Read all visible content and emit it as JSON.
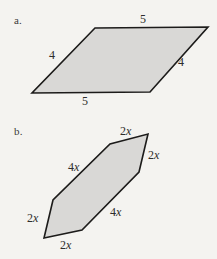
{
  "figure": {
    "background_color": "#f4f3f0",
    "shape_fill_color": "#d9d8d6",
    "shape_stroke_color": "#1c1b1a",
    "parts": [
      {
        "key": "a",
        "marker": "a.",
        "shape": "parallelogram",
        "points": "95,28 208,27 150,92 32,93",
        "labels": [
          {
            "key": "top",
            "text": "5"
          },
          {
            "key": "left",
            "text": "4"
          },
          {
            "key": "right",
            "text": "4"
          },
          {
            "key": "bottom",
            "text": "5"
          }
        ]
      },
      {
        "key": "b",
        "marker": "b.",
        "shape": "hexagon",
        "points": "148,134 139,172 82,230 44,238 53,200 110,144",
        "labels": [
          {
            "key": "top",
            "text": "2x"
          },
          {
            "key": "upper-right",
            "text": "2x"
          },
          {
            "key": "upper-left",
            "text": "4x"
          },
          {
            "key": "lower-right",
            "text": "4x"
          },
          {
            "key": "left",
            "text": "2x"
          },
          {
            "key": "bottom",
            "text": "2x"
          }
        ]
      }
    ]
  }
}
